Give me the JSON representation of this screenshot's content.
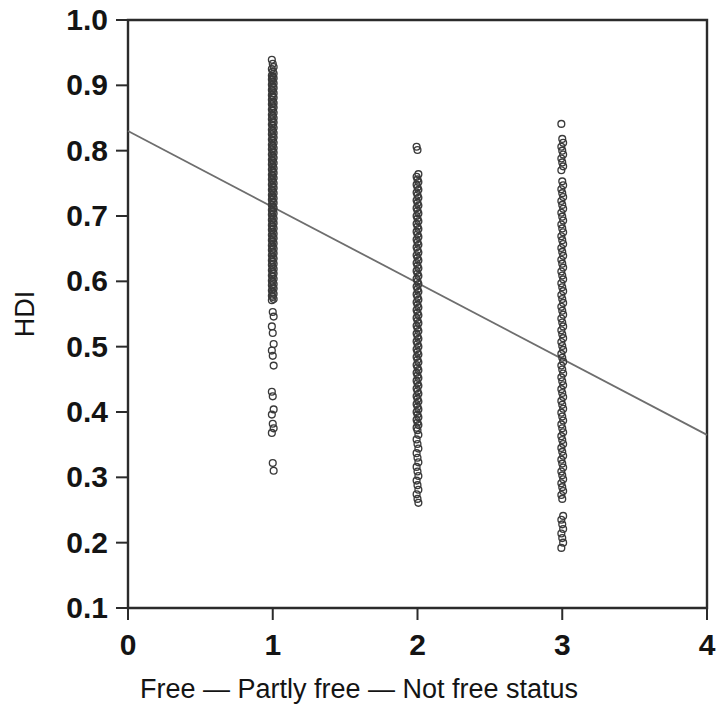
{
  "chart_data": {
    "type": "scatter",
    "title": "",
    "xlabel": "Free — Partly free — Not free status",
    "ylabel": "HDI",
    "xlim": [
      0,
      4
    ],
    "ylim": [
      0.1,
      1.0
    ],
    "xticks": [
      0,
      1,
      2,
      3,
      4
    ],
    "xtick_labels": [
      "0",
      "1",
      "2",
      "3",
      "4"
    ],
    "yticks": [
      0.1,
      0.2,
      0.3,
      0.4,
      0.5,
      0.6,
      0.7,
      0.8,
      0.9,
      1.0
    ],
    "ytick_labels": [
      "0.1",
      "0.2",
      "0.3",
      "0.4",
      "0.5",
      "0.6",
      "0.7",
      "0.8",
      "0.9",
      "1.0"
    ],
    "grid": false,
    "legend": null,
    "marker": "open-circle",
    "marker_color": "#3a3a3a",
    "trend_line": {
      "label": "linear fit",
      "color": "#6e6e6e",
      "x": [
        0,
        4
      ],
      "y": [
        0.83,
        0.365
      ]
    },
    "series": [
      {
        "name": "Free (status 1)",
        "x": 1,
        "values": [
          0.939,
          0.933,
          0.928,
          0.925,
          0.921,
          0.918,
          0.915,
          0.913,
          0.911,
          0.909,
          0.906,
          0.903,
          0.901,
          0.898,
          0.896,
          0.893,
          0.891,
          0.888,
          0.885,
          0.883,
          0.881,
          0.878,
          0.875,
          0.873,
          0.871,
          0.868,
          0.866,
          0.863,
          0.861,
          0.858,
          0.855,
          0.853,
          0.85,
          0.848,
          0.845,
          0.843,
          0.84,
          0.838,
          0.835,
          0.832,
          0.83,
          0.827,
          0.825,
          0.822,
          0.82,
          0.817,
          0.815,
          0.812,
          0.809,
          0.807,
          0.804,
          0.802,
          0.799,
          0.797,
          0.794,
          0.791,
          0.789,
          0.786,
          0.784,
          0.781,
          0.779,
          0.776,
          0.773,
          0.771,
          0.768,
          0.766,
          0.763,
          0.761,
          0.758,
          0.756,
          0.753,
          0.75,
          0.748,
          0.745,
          0.743,
          0.74,
          0.738,
          0.735,
          0.732,
          0.73,
          0.727,
          0.725,
          0.722,
          0.72,
          0.717,
          0.714,
          0.712,
          0.709,
          0.707,
          0.704,
          0.702,
          0.699,
          0.696,
          0.694,
          0.691,
          0.689,
          0.686,
          0.684,
          0.681,
          0.679,
          0.676,
          0.673,
          0.671,
          0.668,
          0.666,
          0.663,
          0.661,
          0.658,
          0.655,
          0.653,
          0.65,
          0.648,
          0.645,
          0.643,
          0.64,
          0.637,
          0.635,
          0.632,
          0.63,
          0.627,
          0.625,
          0.622,
          0.619,
          0.617,
          0.614,
          0.612,
          0.609,
          0.607,
          0.604,
          0.601,
          0.599,
          0.596,
          0.594,
          0.591,
          0.589,
          0.586,
          0.583,
          0.581,
          0.578,
          0.576,
          0.573,
          0.571,
          0.553,
          0.546,
          0.531,
          0.521,
          0.504,
          0.494,
          0.486,
          0.471,
          0.431,
          0.424,
          0.404,
          0.396,
          0.382,
          0.375,
          0.368,
          0.322,
          0.31
        ]
      },
      {
        "name": "Partly free (status 2)",
        "x": 2,
        "values": [
          0.806,
          0.801,
          0.764,
          0.76,
          0.756,
          0.752,
          0.748,
          0.744,
          0.74,
          0.736,
          0.732,
          0.728,
          0.724,
          0.72,
          0.716,
          0.712,
          0.708,
          0.704,
          0.7,
          0.696,
          0.692,
          0.688,
          0.684,
          0.68,
          0.676,
          0.672,
          0.668,
          0.664,
          0.66,
          0.656,
          0.652,
          0.648,
          0.644,
          0.64,
          0.636,
          0.632,
          0.628,
          0.624,
          0.62,
          0.616,
          0.612,
          0.608,
          0.604,
          0.6,
          0.596,
          0.592,
          0.588,
          0.584,
          0.58,
          0.576,
          0.572,
          0.568,
          0.564,
          0.56,
          0.556,
          0.552,
          0.548,
          0.544,
          0.54,
          0.536,
          0.532,
          0.528,
          0.524,
          0.52,
          0.516,
          0.512,
          0.508,
          0.504,
          0.5,
          0.496,
          0.492,
          0.488,
          0.484,
          0.48,
          0.476,
          0.472,
          0.468,
          0.464,
          0.46,
          0.456,
          0.452,
          0.448,
          0.444,
          0.44,
          0.436,
          0.432,
          0.428,
          0.424,
          0.42,
          0.416,
          0.412,
          0.408,
          0.404,
          0.4,
          0.396,
          0.392,
          0.388,
          0.384,
          0.38,
          0.376,
          0.372,
          0.365,
          0.358,
          0.351,
          0.344,
          0.337,
          0.33,
          0.323,
          0.316,
          0.309,
          0.302,
          0.295,
          0.288,
          0.281,
          0.274,
          0.267,
          0.261
        ]
      },
      {
        "name": "Not free (status 3)",
        "x": 3,
        "values": [
          0.841,
          0.818,
          0.812,
          0.806,
          0.8,
          0.794,
          0.788,
          0.782,
          0.776,
          0.77,
          0.753,
          0.747,
          0.741,
          0.735,
          0.729,
          0.723,
          0.717,
          0.711,
          0.705,
          0.699,
          0.693,
          0.687,
          0.681,
          0.675,
          0.669,
          0.663,
          0.657,
          0.651,
          0.645,
          0.639,
          0.633,
          0.627,
          0.621,
          0.615,
          0.609,
          0.603,
          0.597,
          0.591,
          0.585,
          0.579,
          0.573,
          0.567,
          0.561,
          0.555,
          0.549,
          0.543,
          0.537,
          0.531,
          0.525,
          0.519,
          0.513,
          0.507,
          0.501,
          0.495,
          0.489,
          0.483,
          0.477,
          0.471,
          0.465,
          0.459,
          0.453,
          0.447,
          0.441,
          0.435,
          0.429,
          0.423,
          0.417,
          0.411,
          0.405,
          0.399,
          0.393,
          0.387,
          0.381,
          0.375,
          0.369,
          0.363,
          0.357,
          0.351,
          0.345,
          0.339,
          0.333,
          0.327,
          0.321,
          0.315,
          0.309,
          0.303,
          0.297,
          0.291,
          0.285,
          0.279,
          0.273,
          0.267,
          0.241,
          0.235,
          0.228,
          0.221,
          0.214,
          0.207,
          0.2,
          0.192
        ]
      }
    ]
  },
  "axes": {
    "y_label": "HDI",
    "x_label": "Free — Partly free — Not free status",
    "x_tick_labels": [
      "0",
      "1",
      "2",
      "3",
      "4"
    ],
    "y_tick_labels": [
      "1.0",
      "0.9",
      "0.8",
      "0.7",
      "0.6",
      "0.5",
      "0.4",
      "0.3",
      "0.2",
      "0.1"
    ]
  }
}
